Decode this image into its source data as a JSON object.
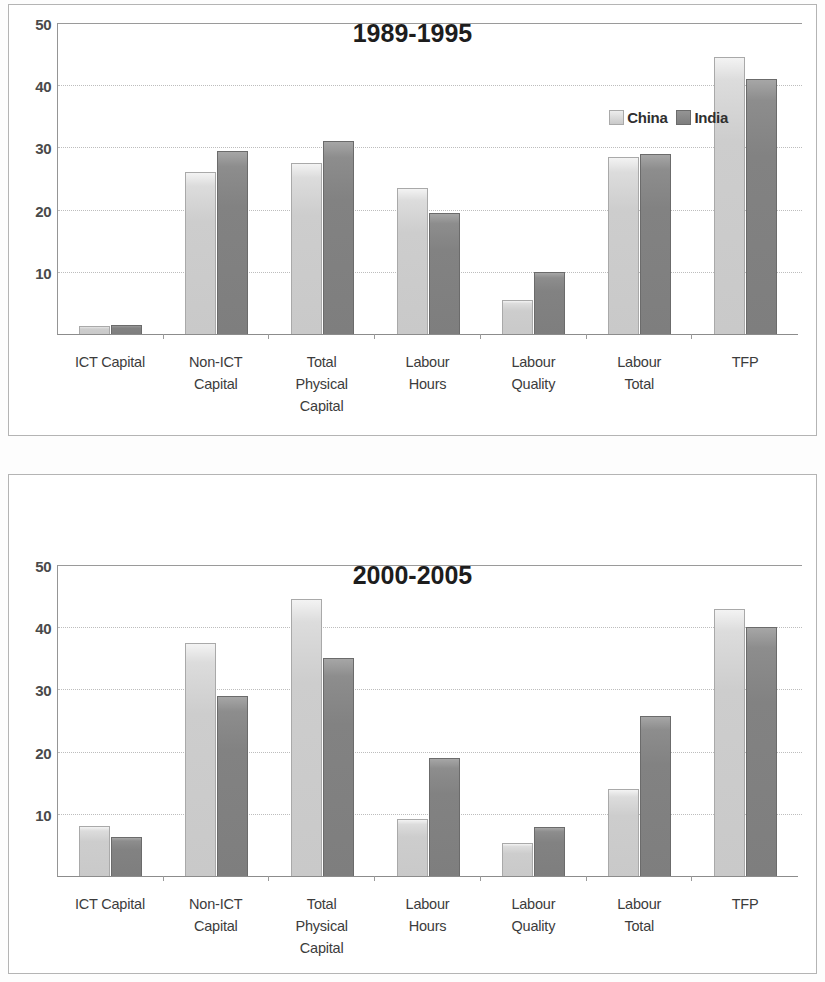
{
  "page": {
    "background": "#ffffff",
    "panel_border_color": "#b4b4b4"
  },
  "colors": {
    "china": "#c9c9c9",
    "india": "#7e7e7e",
    "gridline": "#bdbdbd",
    "axis": "#8c8c8c",
    "title_text": "#1d1d1d",
    "tick_text": "#4a4a4a"
  },
  "legend": {
    "china_label": "China",
    "india_label": "India",
    "position": "top-right-inside"
  },
  "axis": {
    "yticks": [
      "50",
      "40",
      "30",
      "20",
      "10",
      "0"
    ],
    "ymin": 0,
    "ymax": 50
  },
  "categories": [
    [
      "ICT Capital"
    ],
    [
      "Non-ICT",
      "Capital"
    ],
    [
      "Total",
      "Physical",
      "Capital"
    ],
    [
      "Labour",
      "Hours"
    ],
    [
      "Labour",
      "Quality"
    ],
    [
      "Labour",
      "Total"
    ],
    [
      "TFP"
    ]
  ],
  "chart_data": [
    {
      "type": "bar",
      "title": "1989-1995",
      "xlabel": "",
      "ylabel": "",
      "ylim": [
        0,
        50
      ],
      "yticks": [
        0,
        10,
        20,
        30,
        40,
        50
      ],
      "grid": true,
      "legend": "upper right",
      "categories": [
        "ICT Capital",
        "Non-ICT Capital",
        "Total Physical Capital",
        "Labour Hours",
        "Labour Quality",
        "Labour Total",
        "TFP"
      ],
      "series": [
        {
          "name": "China",
          "color": "#c9c9c9",
          "values": [
            1.3,
            26.0,
            27.5,
            23.5,
            5.5,
            28.5,
            44.5
          ]
        },
        {
          "name": "India",
          "color": "#7e7e7e",
          "values": [
            1.5,
            29.5,
            31.0,
            19.5,
            10.0,
            29.0,
            41.0
          ]
        }
      ]
    },
    {
      "type": "bar",
      "title": "2000-2005",
      "xlabel": "",
      "ylabel": "",
      "ylim": [
        0,
        50
      ],
      "yticks": [
        0,
        10,
        20,
        30,
        40,
        50
      ],
      "grid": true,
      "legend": "upper right",
      "categories": [
        "ICT Capital",
        "Non-ICT Capital",
        "Total Physical Capital",
        "Labour Hours",
        "Labour Quality",
        "Labour Total",
        "TFP"
      ],
      "series": [
        {
          "name": "China",
          "color": "#c9c9c9",
          "values": [
            8.0,
            37.5,
            44.5,
            9.2,
            5.3,
            14.0,
            43.0
          ]
        },
        {
          "name": "India",
          "color": "#7e7e7e",
          "values": [
            6.3,
            29.0,
            35.0,
            19.0,
            7.8,
            25.7,
            40.0
          ]
        }
      ]
    }
  ]
}
